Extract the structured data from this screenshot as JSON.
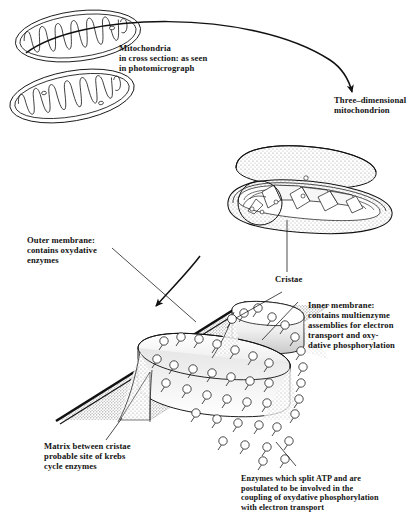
{
  "figure": {
    "ink_color": "#111111",
    "shade_color": "#9a9a9a"
  },
  "labels": {
    "cross_section": "Mitochondria\nin cross section:  as seen\nin photomicrograph",
    "three_dimensional": "Three–dimensional\nmitochondrion",
    "outer_membrane": "Outer membrane:\ncontains oxydative\nenzymes",
    "cristae": "Cristae",
    "inner_membrane": "Inner membrane:\ncontains multienzyme\nassemblies for electron\ntransport and oxy-\ndative phosphorylation",
    "matrix": "Matrix between cristae\nprobable site of krebs\ncycle enzymes",
    "enzymes": "Enzymes which split ATP and are\npostulated to be involved in the\ncoupling of oxydative phosphorylation\nwith electron transport"
  }
}
